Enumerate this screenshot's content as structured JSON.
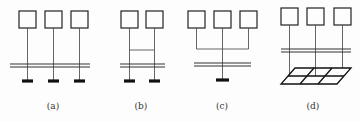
{
  "diagram": {
    "panels": [
      {
        "id": "a",
        "label": "(a)",
        "boxes": 3,
        "topology": "each box connects down through bus to its own ground electrode"
      },
      {
        "id": "b",
        "label": "(b)",
        "boxes": 2,
        "topology": "two boxes cross-linked above bus, each to own ground electrode"
      },
      {
        "id": "c",
        "label": "(c)",
        "boxes": 3,
        "topology": "boxes joined by common horizontal conductor to a single ground electrode"
      },
      {
        "id": "d",
        "label": "(d)",
        "boxes": 3,
        "topology": "boxes connect down to a meshed grounding grid"
      }
    ],
    "colors": {
      "line": "#222222",
      "background": "#fdfdfd"
    }
  }
}
